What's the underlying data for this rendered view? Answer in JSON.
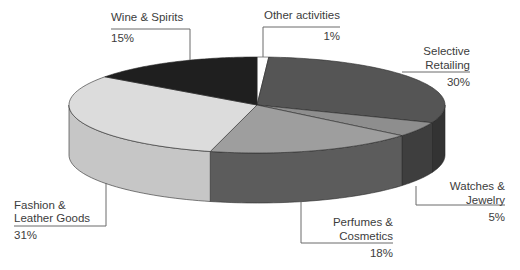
{
  "chart_data": {
    "type": "pie",
    "style": "3d",
    "title": "",
    "start": "top",
    "direction": "clockwise",
    "slices": [
      {
        "key": "other",
        "label_lines": [
          "Other activities"
        ],
        "value_label": "1%",
        "value": 1,
        "top_color": "#ffffff",
        "side_color": "#f2f2f2",
        "label_align": "end"
      },
      {
        "key": "selective",
        "label_lines": [
          "Selective",
          "Retailing"
        ],
        "value_label": "30%",
        "value": 30,
        "top_color": "#555555",
        "side_color": "#333333",
        "label_align": "end"
      },
      {
        "key": "watches",
        "label_lines": [
          "Watches &",
          "Jewelry"
        ],
        "value_label": "5%",
        "value": 5,
        "top_color": "#8e8e8e",
        "side_color": "#3e3e3e",
        "label_align": "end"
      },
      {
        "key": "perfumes",
        "label_lines": [
          "Perfumes &",
          "Cosmetics"
        ],
        "value_label": "18%",
        "value": 18,
        "top_color": "#9e9e9e",
        "side_color": "#5c5c5c",
        "label_align": "end"
      },
      {
        "key": "fashion",
        "label_lines": [
          "Fashion &",
          "Leather Goods"
        ],
        "value_label": "31%",
        "value": 31,
        "top_color": "#dcdcdc",
        "side_color": "#c6c6c6",
        "label_align": "start"
      },
      {
        "key": "wine",
        "label_lines": [
          "Wine & Spirits"
        ],
        "value_label": "15%",
        "value": 15,
        "top_color": "#1f1f1f",
        "side_color": "#141414",
        "label_align": "start"
      }
    ]
  }
}
